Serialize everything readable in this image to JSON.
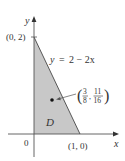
{
  "figure": {
    "type": "region-diagram",
    "colors": {
      "region_fill": "#c8c8c8",
      "axis": "#555555",
      "boundary": "#333333",
      "text": "#333333",
      "background": "#ffffff"
    },
    "axes": {
      "x_label": "x",
      "y_label": "y",
      "origin_label": "0"
    },
    "points": {
      "y_intercept": "(0, 2)",
      "x_intercept": "(1, 0)"
    },
    "curve": {
      "equation_lhs": "y",
      "equation_eq": "=",
      "equation_rhs": "2 − 2x"
    },
    "region": {
      "label": "D"
    },
    "centroid": {
      "x_num": "3",
      "x_den": "8",
      "y_num": "11",
      "y_den": "16",
      "open_paren": "(",
      "close_paren": ")",
      "comma": ","
    }
  }
}
